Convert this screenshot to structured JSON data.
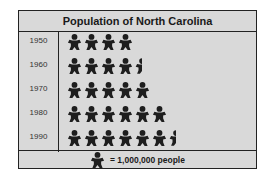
{
  "chart_data": {
    "type": "pictograph",
    "title": "Population of North Carolina",
    "categories": [
      "1950",
      "1960",
      "1970",
      "1980",
      "1990"
    ],
    "values": [
      4000000,
      4500000,
      5000000,
      6000000,
      6500000
    ],
    "icon_counts": [
      4,
      4.5,
      5,
      6,
      6.5
    ],
    "key": {
      "icon": "person-icon",
      "label": "= 1,000,000 people",
      "value": 1000000
    },
    "xlabel": "",
    "ylabel": ""
  },
  "colors": {
    "background": "#d9d9d9",
    "icon": "#1e1e1e",
    "border": "#222222"
  }
}
